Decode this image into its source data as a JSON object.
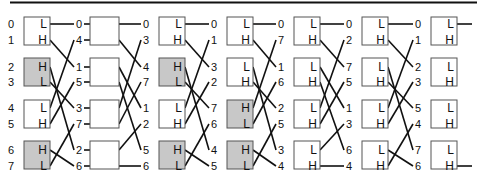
{
  "diagram": {
    "title": "",
    "type": "sorting-network",
    "colors": {
      "white_box": "#ffffff",
      "gray_box": "#c8c8c8",
      "line": "#111111",
      "box_border": "#555555"
    },
    "row_y": [
      24,
      40,
      67,
      82,
      108,
      124,
      150,
      166
    ],
    "box_tops": [
      17,
      58,
      100,
      141
    ],
    "box_height": 28,
    "columns": [
      {
        "labels": [
          "0",
          "1",
          "2",
          "3",
          "4",
          "5",
          "6",
          "7"
        ],
        "box_x": 24,
        "box_w": 26,
        "label_x": 14,
        "boxes": [
          {
            "top": "L",
            "bottom": "H",
            "fill": "white"
          },
          {
            "top": "H",
            "bottom": "L",
            "fill": "gray"
          },
          {
            "top": "L",
            "bottom": "H",
            "fill": "white"
          },
          {
            "top": "H",
            "bottom": "L",
            "fill": "gray"
          }
        ]
      },
      {
        "labels": [
          "0",
          "4",
          "1",
          "5",
          "3",
          "7",
          "2",
          "6"
        ],
        "box_x": 90,
        "box_w": 29,
        "label_x": 82,
        "boxes": [
          {
            "top": "",
            "bottom": "",
            "fill": "white",
            "pass": true
          },
          {
            "top": "",
            "bottom": "",
            "fill": "white",
            "pass": true
          },
          {
            "top": "",
            "bottom": "",
            "fill": "white",
            "pass": true
          },
          {
            "top": "",
            "bottom": "",
            "fill": "white",
            "pass": true
          }
        ]
      },
      {
        "labels": [
          "0",
          "3",
          "4",
          "7",
          "1",
          "2",
          "5",
          "6"
        ],
        "box_x": 159,
        "box_w": 26,
        "label_x": 149,
        "boxes": [
          {
            "top": "L",
            "bottom": "H",
            "fill": "white"
          },
          {
            "top": "H",
            "bottom": "L",
            "fill": "gray"
          },
          {
            "top": "L",
            "bottom": "H",
            "fill": "white"
          },
          {
            "top": "H",
            "bottom": "L",
            "fill": "gray"
          }
        ]
      },
      {
        "labels": [
          "0",
          "1",
          "3",
          "2",
          "7",
          "6",
          "4",
          "5"
        ],
        "box_x": 227,
        "box_w": 26,
        "label_x": 217,
        "boxes": [
          {
            "top": "L",
            "bottom": "H",
            "fill": "white"
          },
          {
            "top": "L",
            "bottom": "H",
            "fill": "white"
          },
          {
            "top": "H",
            "bottom": "L",
            "fill": "gray"
          },
          {
            "top": "H",
            "bottom": "L",
            "fill": "gray"
          }
        ]
      },
      {
        "labels": [
          "0",
          "7",
          "1",
          "6",
          "2",
          "5",
          "3",
          "4"
        ],
        "box_x": 294,
        "box_w": 26,
        "label_x": 284,
        "boxes": [
          {
            "top": "L",
            "bottom": "H",
            "fill": "white"
          },
          {
            "top": "L",
            "bottom": "H",
            "fill": "white"
          },
          {
            "top": "L",
            "bottom": "H",
            "fill": "white"
          },
          {
            "top": "L",
            "bottom": "H",
            "fill": "white"
          }
        ]
      },
      {
        "labels": [
          "0",
          "2",
          "7",
          "5",
          "1",
          "3",
          "6",
          "4"
        ],
        "box_x": 362,
        "box_w": 26,
        "label_x": 352,
        "boxes": [
          {
            "top": "L",
            "bottom": "H",
            "fill": "white"
          },
          {
            "top": "L",
            "bottom": "H",
            "fill": "white"
          },
          {
            "top": "L",
            "bottom": "H",
            "fill": "white"
          },
          {
            "top": "L",
            "bottom": "H",
            "fill": "white"
          }
        ]
      },
      {
        "labels": [
          "0",
          "1",
          "2",
          "3",
          "5",
          "4",
          "7",
          "6"
        ],
        "box_x": 431,
        "box_w": 26,
        "label_x": 421,
        "boxes": [
          {
            "top": "L",
            "bottom": "H",
            "fill": "white"
          },
          {
            "top": "L",
            "bottom": "H",
            "fill": "white"
          },
          {
            "top": "L",
            "bottom": "H",
            "fill": "white"
          },
          {
            "top": "L",
            "bottom": "H",
            "fill": "white"
          }
        ]
      }
    ],
    "final_outputs": [
      {
        "row": 0,
        "to_x": 472
      },
      {
        "row": 7,
        "to_x": 472
      }
    ]
  }
}
